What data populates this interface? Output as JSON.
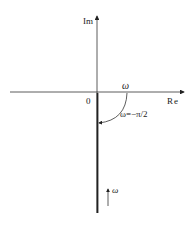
{
  "diagram": {
    "type": "nyquist-plot",
    "axes": {
      "imaginary_label": "Im",
      "real_label": "Re",
      "origin_label": "0"
    },
    "annotations": {
      "arc_omega_label": "ω",
      "phase_label": "ω=−π/2",
      "direction_label": "ω"
    },
    "colors": {
      "line": "#222222",
      "background": "#ffffff"
    }
  }
}
